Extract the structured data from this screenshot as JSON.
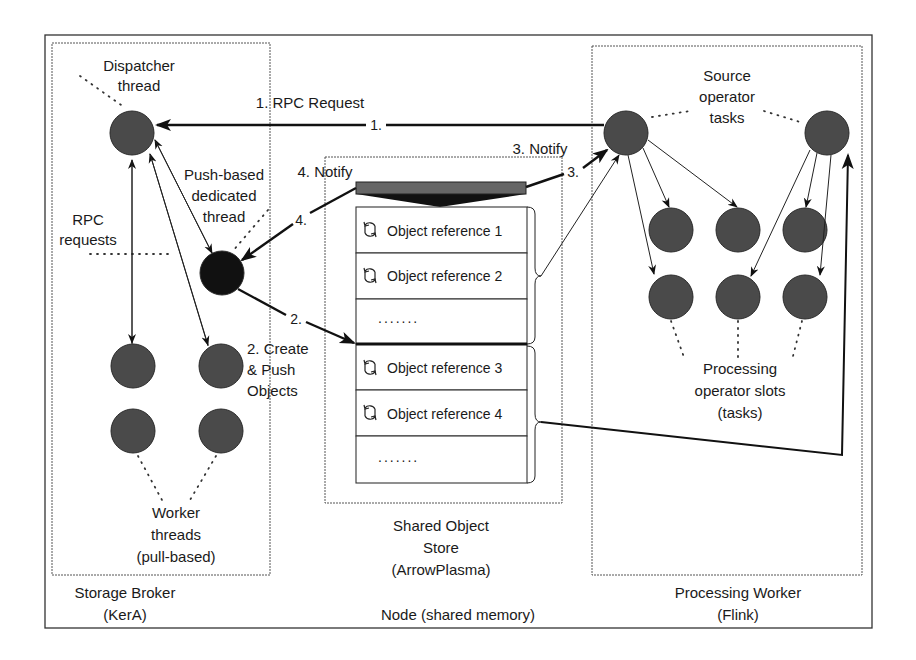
{
  "diagram": {
    "outer_label": "Node (shared memory)",
    "broker": {
      "title_line1": "Storage Broker",
      "title_line2": "(KerA)",
      "dispatcher_line1": "Dispatcher",
      "dispatcher_line2": "thread",
      "push_line1": "Push-based",
      "push_line2": "dedicated",
      "push_line3": "thread",
      "rpc_line1": "RPC",
      "rpc_line2": "requests",
      "worker_line1": "Worker",
      "worker_line2": "threads",
      "worker_line3": "(pull-based)"
    },
    "store": {
      "title_line1": "Shared Object",
      "title_line2": "Store",
      "title_line3": "(ArrowPlasma)",
      "rows": [
        {
          "label": "Object reference 1",
          "icon": "refresh-icon"
        },
        {
          "label": "Object reference 2",
          "icon": "refresh-icon"
        },
        {
          "label": ".......",
          "icon": ""
        },
        {
          "label": "Object reference 3",
          "icon": "refresh-icon"
        },
        {
          "label": "Object reference 4",
          "icon": "refresh-icon"
        },
        {
          "label": ".......",
          "icon": ""
        }
      ]
    },
    "worker": {
      "title_line1": "Processing Worker",
      "title_line2": "(Flink)",
      "source_line1": "Source",
      "source_line2": "operator",
      "source_line3": "tasks",
      "slots_line1": "Processing",
      "slots_line2": "operator slots",
      "slots_line3": "(tasks)"
    },
    "steps": {
      "s1_label": "1. RPC Request",
      "s1_marker": "1.",
      "s2_label_line1": "2. Create",
      "s2_label_line2": "& Push",
      "s2_label_line3": "Objects",
      "s2_marker": "2.",
      "s3_label": "3. Notify",
      "s3_marker": "3.",
      "s4_label": "4. Notify",
      "s4_marker": "4."
    },
    "colors": {
      "node_fill": "#4a4a4a",
      "push_thread_fill": "#111111",
      "notify_bar": "#666666"
    }
  }
}
